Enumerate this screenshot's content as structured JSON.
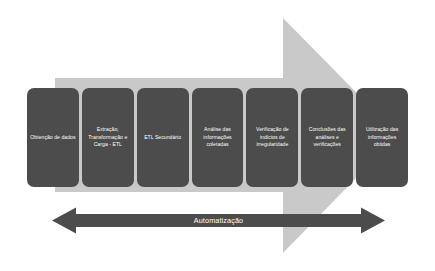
{
  "diagram": {
    "background_color": "#ffffff",
    "background_arrow": {
      "name": "process-flow-arrow",
      "direction": "right",
      "color": "#c9c9c9"
    },
    "stage_box_color": "#4c4c4c",
    "stage_text_color": "#ffffff",
    "stages": [
      {
        "id": "obtencao-de-dados",
        "label": "Obtenção de dados"
      },
      {
        "id": "extracao-transformacao-carga-etl",
        "label": "Extração, Transformação e Carga - ETL"
      },
      {
        "id": "etl-secundario",
        "label": "ETL Secundário"
      },
      {
        "id": "analise-das-informacoes-coletadas",
        "label": "Análise das informações coletadas"
      },
      {
        "id": "verificacao-de-indicios-de-irregularidade",
        "label": "Verificação de indícios de irregularidade"
      },
      {
        "id": "conclusoes-das-analises-e-verificacoes",
        "label": "Conclusões das análises e verificações"
      },
      {
        "id": "utilizacao-das-informacoes-obtidas",
        "label": "Utilização das informações obtidas"
      }
    ],
    "automation": {
      "label": "Automatização",
      "arrow_color": "#4c4c4c",
      "text_color": "#ffffff",
      "direction": "double"
    }
  }
}
